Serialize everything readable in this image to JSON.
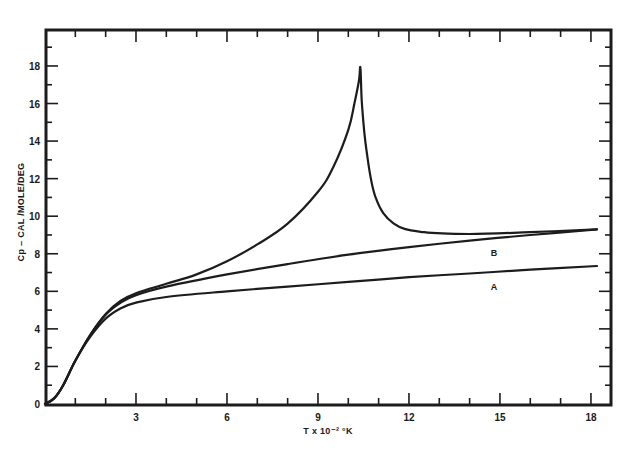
{
  "chart_data": {
    "type": "line",
    "title": "",
    "xlabel": "T x 10⁻² °K",
    "ylabel": "Cp – CAL /MOLE/DEG",
    "xlim": [
      0,
      18.5
    ],
    "ylim": [
      0,
      19.5
    ],
    "x_ticks": [
      3,
      6,
      9,
      12,
      15,
      18
    ],
    "x_tick_labels": [
      "3",
      "6",
      "9",
      "12",
      "15",
      "18"
    ],
    "y_ticks": [
      0,
      2,
      4,
      6,
      8,
      10,
      12,
      14,
      16,
      18
    ],
    "y_tick_labels": [
      "0",
      "2",
      "4",
      "6",
      "8",
      "10",
      "12",
      "14",
      "16",
      "18"
    ],
    "grid": false,
    "legend": "inline curve labels",
    "series": [
      {
        "name": "lambda-anomaly (unlabeled)",
        "x": [
          0,
          0.3,
          0.6,
          1.0,
          1.5,
          2.0,
          2.5,
          3.0,
          4.0,
          5.0,
          6.0,
          7.0,
          8.0,
          9.0,
          9.5,
          10.0,
          10.2,
          10.35,
          10.4,
          10.45,
          10.6,
          10.9,
          11.5,
          12.5,
          14.0,
          16.0,
          18.2
        ],
        "y": [
          0,
          0.3,
          1.0,
          2.3,
          3.7,
          4.8,
          5.5,
          5.9,
          6.4,
          6.9,
          7.6,
          8.5,
          9.6,
          11.3,
          12.6,
          14.6,
          16.0,
          17.2,
          17.9,
          16.0,
          13.5,
          11.0,
          9.6,
          9.15,
          9.05,
          9.15,
          9.3
        ]
      },
      {
        "name": "B",
        "x": [
          0,
          0.3,
          0.6,
          1.0,
          1.5,
          2.0,
          2.5,
          3.0,
          4.0,
          6.0,
          8.0,
          10.0,
          12.0,
          14.0,
          16.0,
          18.2
        ],
        "y": [
          0,
          0.3,
          1.0,
          2.3,
          3.7,
          4.75,
          5.4,
          5.8,
          6.25,
          6.9,
          7.45,
          7.95,
          8.35,
          8.7,
          9.0,
          9.3
        ]
      },
      {
        "name": "A",
        "x": [
          0,
          0.3,
          0.6,
          1.0,
          1.5,
          2.0,
          2.5,
          3.0,
          4.0,
          6.0,
          8.0,
          10.0,
          12.0,
          14.0,
          16.0,
          18.2
        ],
        "y": [
          0,
          0.3,
          1.0,
          2.3,
          3.6,
          4.55,
          5.1,
          5.4,
          5.7,
          6.0,
          6.25,
          6.5,
          6.75,
          6.95,
          7.15,
          7.35
        ]
      }
    ],
    "annotations": [
      {
        "text": "B",
        "x": 14.8,
        "y": 7.9
      },
      {
        "text": "A",
        "x": 14.8,
        "y": 6.05
      }
    ]
  }
}
